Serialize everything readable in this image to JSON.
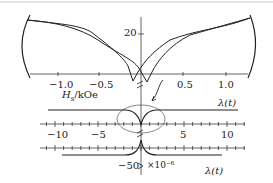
{
  "figure": {
    "top_panel": {
      "y_tick": "20",
      "x_ticks": [
        "−1.0",
        "−0.5",
        "0.5",
        "1.0"
      ],
      "x_label": "H_s/kOe",
      "x_label_main": "H",
      "x_label_sub": "s",
      "x_label_unit": "/kOe"
    },
    "middle_panel": {
      "curve_label": "λ(t)",
      "x_ticks": [
        "−10",
        "−5",
        "5",
        "10"
      ]
    },
    "bottom_panel": {
      "curve_label": "λ(t)",
      "y_tick": "−50",
      "scale_note": "×10⁻⁶"
    }
  },
  "chart_data": {
    "type": "line",
    "title": "",
    "panels": [
      {
        "name": "hysteresis loop",
        "xlabel": "H_s/kOe",
        "x_ticks": [
          -1.0,
          -0.5,
          0.5,
          1.0
        ],
        "y_ticks": [
          20
        ],
        "xlim": [
          -1.25,
          1.25
        ]
      },
      {
        "name": "λ(t) positive",
        "x_ticks": [
          -10,
          -5,
          5,
          10
        ],
        "label": "λ(t)"
      },
      {
        "name": "λ(t) negative",
        "y_ticks": [
          -50
        ],
        "label": "λ(t)",
        "scale": "×10⁻⁶"
      }
    ]
  }
}
